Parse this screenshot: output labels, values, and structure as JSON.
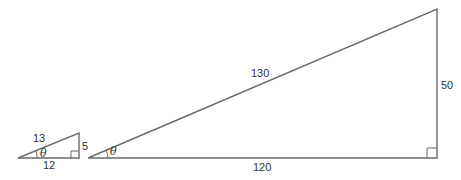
{
  "diagram": {
    "small_triangle": {
      "hypotenuse": "13",
      "opposite": "5",
      "adjacent": "12",
      "angle": "θ"
    },
    "large_triangle": {
      "hypotenuse": "130",
      "opposite": "50",
      "adjacent": "120",
      "angle": "θ"
    },
    "colors": {
      "line": "#6b6b6b",
      "text": "#333333"
    }
  }
}
